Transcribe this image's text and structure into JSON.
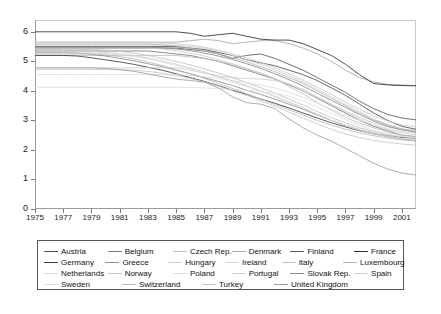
{
  "chart_data": {
    "type": "line",
    "title": "",
    "xlabel": "",
    "ylabel": "",
    "xlim": [
      1975,
      2002
    ],
    "ylim": [
      0,
      6.4
    ],
    "grid": false,
    "legend_position": "bottom",
    "x_ticks": [
      "1975",
      "1977",
      "1979",
      "1981",
      "1983",
      "1985",
      "1987",
      "1989",
      "1991",
      "1993",
      "1995",
      "1997",
      "1999",
      "2001"
    ],
    "y_ticks": [
      "0",
      "1",
      "2",
      "3",
      "4",
      "5",
      "6"
    ],
    "x": [
      1975,
      1976,
      1977,
      1978,
      1979,
      1980,
      1981,
      1982,
      1983,
      1984,
      1985,
      1986,
      1987,
      1988,
      1989,
      1990,
      1991,
      1992,
      1993,
      1994,
      1995,
      1996,
      1997,
      1998,
      1999,
      2000,
      2001,
      2002
    ],
    "series": [
      {
        "name": "Austria",
        "color": "#4d4d4d",
        "values": [
          5.5,
          5.5,
          5.5,
          5.5,
          5.5,
          5.5,
          5.5,
          5.5,
          5.5,
          5.5,
          5.5,
          5.45,
          5.4,
          5.3,
          5.2,
          5.05,
          4.95,
          4.85,
          4.7,
          4.55,
          4.35,
          4.1,
          3.85,
          3.55,
          3.25,
          3.0,
          2.8,
          2.7
        ]
      },
      {
        "name": "Belgium",
        "color": "#7a7a7a",
        "values": [
          5.35,
          5.35,
          5.35,
          5.35,
          5.35,
          5.35,
          5.35,
          5.35,
          5.35,
          5.3,
          5.25,
          5.2,
          5.1,
          5.0,
          4.85,
          4.7,
          4.55,
          4.4,
          4.2,
          4.0,
          3.75,
          3.5,
          3.25,
          3.0,
          2.8,
          2.65,
          2.5,
          2.45
        ]
      },
      {
        "name": "Czech Rep.",
        "color": "#bdbdbd",
        "values": [
          5.2,
          5.2,
          5.2,
          5.2,
          5.2,
          5.2,
          5.2,
          5.2,
          5.2,
          5.2,
          5.2,
          5.15,
          5.1,
          5.0,
          4.9,
          4.75,
          4.6,
          4.4,
          4.15,
          3.9,
          3.6,
          3.35,
          3.1,
          2.9,
          2.75,
          2.6,
          2.5,
          2.45
        ]
      },
      {
        "name": "Denmark",
        "color": "#a8a8a8",
        "values": [
          5.65,
          5.65,
          5.65,
          5.65,
          5.65,
          5.65,
          5.65,
          5.65,
          5.65,
          5.65,
          5.65,
          5.7,
          5.75,
          5.7,
          5.6,
          5.65,
          5.7,
          5.7,
          5.6,
          5.45,
          5.25,
          5.0,
          4.7,
          4.45,
          4.3,
          4.22,
          4.2,
          4.18
        ]
      },
      {
        "name": "Finland",
        "color": "#5a5a5a",
        "values": [
          5.45,
          5.45,
          5.45,
          5.45,
          5.45,
          5.45,
          5.45,
          5.45,
          5.45,
          5.45,
          5.45,
          5.4,
          5.35,
          5.25,
          5.1,
          5.2,
          5.25,
          5.1,
          4.9,
          4.7,
          4.45,
          4.2,
          3.95,
          3.65,
          3.4,
          3.2,
          3.08,
          3.02
        ]
      },
      {
        "name": "France",
        "color": "#2f2f2f",
        "values": [
          6.0,
          6.0,
          6.0,
          6.0,
          6.0,
          6.0,
          6.0,
          6.0,
          6.0,
          6.0,
          6.0,
          5.95,
          5.85,
          5.9,
          5.95,
          5.85,
          5.75,
          5.72,
          5.72,
          5.6,
          5.4,
          5.2,
          4.9,
          4.55,
          4.25,
          4.2,
          4.18,
          4.17
        ]
      },
      {
        "name": "Germany",
        "color": "#3d3d3d",
        "values": [
          5.2,
          5.2,
          5.2,
          5.18,
          5.12,
          5.05,
          4.98,
          4.9,
          4.8,
          4.7,
          4.58,
          4.45,
          4.32,
          4.18,
          4.02,
          3.88,
          3.72,
          3.58,
          3.42,
          3.25,
          3.08,
          2.92,
          2.78,
          2.65,
          2.55,
          2.48,
          2.42,
          2.4
        ]
      },
      {
        "name": "Greece",
        "color": "#909090",
        "values": [
          5.3,
          5.3,
          5.3,
          5.28,
          5.24,
          5.18,
          5.1,
          5.02,
          4.92,
          4.82,
          4.7,
          4.58,
          4.45,
          4.32,
          4.18,
          4.02,
          3.88,
          3.72,
          3.55,
          3.38,
          3.18,
          3.0,
          2.82,
          2.68,
          2.55,
          2.45,
          2.38,
          2.32
        ]
      },
      {
        "name": "Hungary",
        "color": "#cfcfcf",
        "values": [
          4.78,
          4.78,
          4.78,
          4.78,
          4.78,
          4.78,
          4.78,
          4.78,
          4.78,
          4.78,
          4.78,
          4.7,
          4.6,
          4.5,
          4.45,
          4.42,
          4.4,
          4.35,
          4.25,
          4.05,
          3.8,
          3.55,
          3.3,
          3.05,
          2.85,
          2.7,
          2.58,
          2.52
        ]
      },
      {
        "name": "Ireland",
        "color": "#d4d4d4",
        "values": [
          5.55,
          5.55,
          5.55,
          5.55,
          5.55,
          5.55,
          5.55,
          5.55,
          5.55,
          5.55,
          5.55,
          5.5,
          5.45,
          5.35,
          5.2,
          5.05,
          4.9,
          4.72,
          4.52,
          4.3,
          4.05,
          3.8,
          3.55,
          3.3,
          3.05,
          2.85,
          2.7,
          2.6
        ]
      },
      {
        "name": "Italy",
        "color": "#c2c2c2",
        "values": [
          5.4,
          5.4,
          5.4,
          5.4,
          5.4,
          5.38,
          5.34,
          5.28,
          5.2,
          5.1,
          5.0,
          4.88,
          4.75,
          4.6,
          4.45,
          4.28,
          4.1,
          3.92,
          3.72,
          3.52,
          3.3,
          3.1,
          2.92,
          2.75,
          2.62,
          2.52,
          2.45,
          2.4
        ]
      },
      {
        "name": "Luxembourg",
        "color": "#b5b5b5",
        "values": [
          5.58,
          5.58,
          5.58,
          5.58,
          5.58,
          5.58,
          5.58,
          5.58,
          5.58,
          5.56,
          5.52,
          5.45,
          5.36,
          5.25,
          5.12,
          4.98,
          4.82,
          4.65,
          4.45,
          4.25,
          4.0,
          3.75,
          3.5,
          3.25,
          3.02,
          2.85,
          2.72,
          2.65
        ]
      },
      {
        "name": "Netherlands",
        "color": "#d9d9d9",
        "values": [
          5.28,
          5.28,
          5.28,
          5.28,
          5.28,
          5.26,
          5.22,
          5.16,
          5.08,
          4.98,
          4.86,
          4.74,
          4.6,
          4.46,
          4.3,
          4.14,
          3.98,
          3.8,
          3.62,
          3.42,
          3.22,
          3.02,
          2.85,
          2.7,
          2.58,
          2.48,
          2.4,
          2.35
        ]
      },
      {
        "name": "Norway",
        "color": "#cacaca",
        "values": [
          5.62,
          5.62,
          5.62,
          5.62,
          5.62,
          5.62,
          5.62,
          5.62,
          5.62,
          5.62,
          5.6,
          5.55,
          5.48,
          5.38,
          5.26,
          5.12,
          4.96,
          4.78,
          4.58,
          4.36,
          4.12,
          3.88,
          3.62,
          3.38,
          3.15,
          2.98,
          2.85,
          2.78
        ]
      },
      {
        "name": "Poland",
        "color": "#dddddd",
        "values": [
          4.55,
          4.55,
          4.55,
          4.55,
          4.55,
          4.55,
          4.55,
          4.55,
          4.55,
          4.55,
          4.55,
          4.52,
          4.48,
          4.42,
          4.35,
          4.28,
          4.2,
          4.1,
          3.95,
          3.78,
          3.58,
          3.38,
          3.18,
          3.0,
          2.85,
          2.72,
          2.62,
          2.55
        ]
      },
      {
        "name": "Portugal",
        "color": "#cccccc",
        "values": [
          5.45,
          5.45,
          5.45,
          5.45,
          5.45,
          5.45,
          5.45,
          5.45,
          5.45,
          5.42,
          5.36,
          5.28,
          5.18,
          5.06,
          4.92,
          4.76,
          4.6,
          4.42,
          4.22,
          4.0,
          3.78,
          3.55,
          3.32,
          3.1,
          2.92,
          2.78,
          2.68,
          2.62
        ]
      },
      {
        "name": "Slovak Rep.",
        "color": "#8a8a8a",
        "values": [
          5.48,
          5.48,
          5.48,
          5.48,
          5.48,
          5.48,
          5.48,
          5.48,
          5.48,
          5.46,
          5.42,
          5.36,
          5.28,
          5.18,
          5.06,
          4.92,
          4.76,
          4.58,
          4.38,
          4.16,
          3.92,
          3.68,
          3.44,
          3.2,
          2.98,
          2.8,
          2.68,
          2.6
        ]
      },
      {
        "name": "Spain",
        "color": "#d0d0d0",
        "values": [
          5.32,
          5.32,
          5.32,
          5.32,
          5.32,
          5.3,
          5.26,
          5.2,
          5.12,
          5.02,
          4.9,
          4.78,
          4.64,
          4.5,
          4.34,
          4.18,
          4.0,
          3.82,
          3.62,
          3.42,
          3.2,
          3.0,
          2.82,
          2.66,
          2.54,
          2.44,
          2.36,
          2.3
        ]
      },
      {
        "name": "Sweden",
        "color": "#dedede",
        "values": [
          4.12,
          4.12,
          4.12,
          4.12,
          4.12,
          4.12,
          4.12,
          4.12,
          4.12,
          4.12,
          4.12,
          4.12,
          4.1,
          4.08,
          4.05,
          4.02,
          3.98,
          3.92,
          3.82,
          3.66,
          3.46,
          3.24,
          3.02,
          2.82,
          2.66,
          2.54,
          2.46,
          2.42
        ]
      },
      {
        "name": "Switzerland",
        "color": "#b8b8b8",
        "values": [
          5.25,
          5.25,
          5.25,
          5.25,
          5.25,
          5.22,
          5.16,
          5.08,
          4.98,
          4.86,
          4.72,
          4.58,
          4.42,
          4.26,
          4.08,
          3.9,
          3.72,
          3.54,
          3.36,
          3.18,
          3.0,
          2.84,
          2.7,
          2.58,
          2.48,
          2.4,
          2.34,
          2.3
        ]
      },
      {
        "name": "Turkey",
        "color": "#c7c7c7",
        "values": [
          4.72,
          4.72,
          4.72,
          4.72,
          4.72,
          4.72,
          4.72,
          4.7,
          4.66,
          4.6,
          4.52,
          4.42,
          4.3,
          4.16,
          4.0,
          3.84,
          3.66,
          3.48,
          3.28,
          3.08,
          2.88,
          2.7,
          2.54,
          2.42,
          2.32,
          2.25,
          2.2,
          2.16
        ]
      },
      {
        "name": "United Kingdom",
        "color": "#9e9e9e",
        "values": [
          4.78,
          4.78,
          4.78,
          4.78,
          4.78,
          4.76,
          4.72,
          4.66,
          4.58,
          4.48,
          4.4,
          4.35,
          4.3,
          4.1,
          3.8,
          3.6,
          3.55,
          3.4,
          3.05,
          2.75,
          2.5,
          2.3,
          2.05,
          1.8,
          1.55,
          1.35,
          1.22,
          1.15
        ]
      }
    ]
  },
  "legend": {
    "rows": [
      [
        {
          "label": "Austria",
          "color": "#4d4d4d",
          "show_swatch": true
        },
        {
          "label": "Belgium",
          "color": "#7a7a7a",
          "show_swatch": true
        },
        {
          "label": "Czech Rep.",
          "color": "#bdbdbd",
          "show_swatch": true
        },
        {
          "label": "Denmark",
          "color": "#a8a8a8",
          "show_swatch": true
        },
        {
          "label": "Finland",
          "color": "#5a5a5a",
          "show_swatch": true
        },
        {
          "label": "France",
          "color": "#2f2f2f",
          "show_swatch": true
        }
      ],
      [
        {
          "label": "Germany",
          "color": "#3d3d3d",
          "show_swatch": true
        },
        {
          "label": "Greece",
          "color": "#909090",
          "show_swatch": true
        },
        {
          "label": "Hungary",
          "color": "#cfcfcf",
          "show_swatch": true
        },
        {
          "label": "Ireland",
          "color": "#d4d4d4",
          "show_swatch": true
        },
        {
          "label": "Italy",
          "color": "#c2c2c2",
          "show_swatch": true
        },
        {
          "label": "Luxembourg",
          "color": "#b5b5b5",
          "show_swatch": true
        }
      ],
      [
        {
          "label": "Netherlands",
          "color": "#d9d9d9",
          "show_swatch": true
        },
        {
          "label": "Norway",
          "color": "#cacaca",
          "show_swatch": true
        },
        {
          "label": "Poland",
          "color": "#dddddd",
          "show_swatch": true
        },
        {
          "label": "Portugal",
          "color": "#cccccc",
          "show_swatch": true
        },
        {
          "label": "Slovak Rep.",
          "color": "#8a8a8a",
          "show_swatch": true
        },
        {
          "label": "Spain",
          "color": "#d0d0d0",
          "show_swatch": true
        }
      ],
      [
        {
          "label": "Sweden",
          "color": "#dedede",
          "show_swatch": true
        },
        {
          "label": "Switzerland",
          "color": "#b8b8b8",
          "show_swatch": true
        },
        {
          "label": "Turkey",
          "color": "#c7c7c7",
          "show_swatch": true
        },
        {
          "label": "United Kingdom",
          "color": "#9e9e9e",
          "show_swatch": true
        }
      ]
    ]
  },
  "style": {
    "axis_color": "#9a9a9a",
    "frame_color": "#c9c9c9",
    "legend_border": "#555555",
    "background": "#ffffff"
  }
}
